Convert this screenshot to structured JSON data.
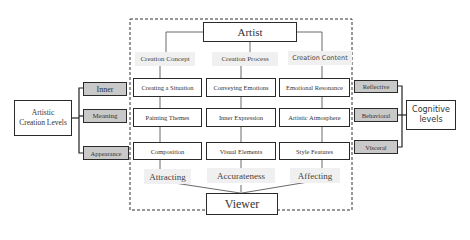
{
  "artist": "Artist",
  "viewer": "Viewer",
  "headers": [
    "Creation Concept",
    "Creation Process",
    "Creation Content"
  ],
  "grid": [
    [
      "Creating a Situation",
      "Conveying Emotions",
      "Emotional Resonance"
    ],
    [
      "Painting Themes",
      "Inner Expression",
      "Artistic Atmosphere"
    ],
    [
      "Composition",
      "Visual Elements",
      "Style Features"
    ]
  ],
  "effects": [
    "Attracting",
    "Accurateness",
    "Affecting"
  ],
  "left": {
    "title": "Artistic Creation Levels",
    "levels": [
      "Inner",
      "Meaning",
      "Appearance"
    ]
  },
  "right": {
    "title": "Cognitive levels",
    "levels": [
      "Reflective",
      "Behavioral",
      "Visceral"
    ]
  }
}
